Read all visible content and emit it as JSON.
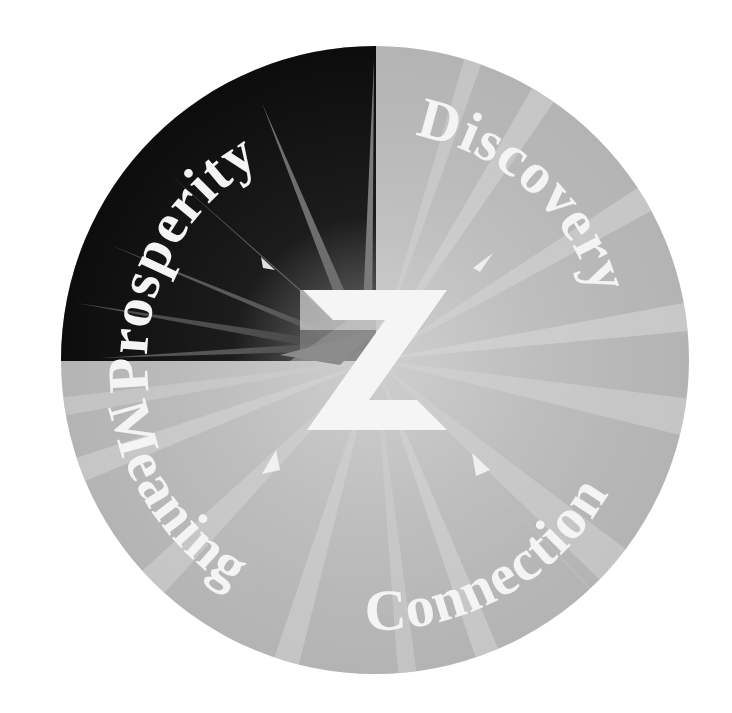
{
  "diagram": {
    "center_letter": "Z",
    "segments": [
      {
        "id": "prosperity",
        "label": "Prosperity",
        "quadrant": "top-left",
        "highlighted": true
      },
      {
        "id": "discovery",
        "label": "Discovery",
        "quadrant": "top-right",
        "highlighted": false
      },
      {
        "id": "connection",
        "label": "Connection",
        "quadrant": "bottom-right",
        "highlighted": false
      },
      {
        "id": "meaning",
        "label": "Meaning",
        "quadrant": "bottom-left",
        "highlighted": false
      }
    ],
    "colors": {
      "highlight_dark": "#111111",
      "base_gray": "#b9b9b9",
      "ray_light": "#d6d6d6",
      "label_fill": "#f4f4f4",
      "background": "#ffffff"
    }
  }
}
